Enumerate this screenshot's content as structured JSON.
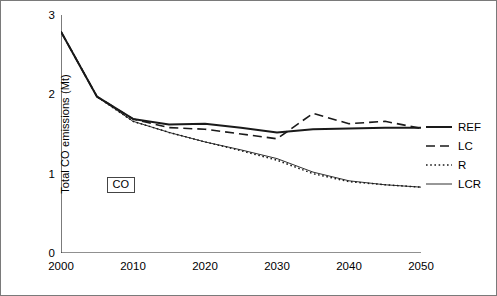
{
  "chart_data": {
    "type": "line",
    "title": "",
    "xlabel": "",
    "ylabel": "Total CO emissions (Mt)",
    "xlim": [
      2000,
      2050
    ],
    "ylim": [
      0,
      3
    ],
    "xticks": [
      2000,
      2010,
      2020,
      2030,
      2040,
      2050
    ],
    "yticks": [
      0,
      1,
      2,
      3
    ],
    "grid": false,
    "legend_position": "right",
    "annotations": [
      {
        "text": "CO",
        "x": 2008,
        "y": 0.85
      }
    ],
    "x": [
      2000,
      2005,
      2010,
      2015,
      2020,
      2025,
      2030,
      2035,
      2040,
      2045,
      2050
    ],
    "series": [
      {
        "name": "REF",
        "style": "solid",
        "color": "#1a1a1a",
        "values": [
          2.79,
          1.97,
          1.69,
          1.62,
          1.63,
          1.58,
          1.52,
          1.56,
          1.57,
          1.58,
          1.58
        ]
      },
      {
        "name": "LC",
        "style": "dashed",
        "color": "#1a1a1a",
        "values": [
          2.79,
          1.97,
          1.69,
          1.58,
          1.56,
          1.5,
          1.44,
          1.76,
          1.63,
          1.66,
          1.57
        ]
      },
      {
        "name": "R",
        "style": "dotted",
        "color": "#1a1a1a",
        "values": [
          2.79,
          1.97,
          1.66,
          1.52,
          1.4,
          1.29,
          1.17,
          1.0,
          0.9,
          0.86,
          0.83
        ]
      },
      {
        "name": "LCR",
        "style": "thin-solid",
        "color": "#1a1a1a",
        "values": [
          2.79,
          1.97,
          1.66,
          1.52,
          1.4,
          1.3,
          1.19,
          1.02,
          0.91,
          0.86,
          0.83
        ]
      }
    ]
  },
  "legend": {
    "items": [
      {
        "label": "REF"
      },
      {
        "label": "LC"
      },
      {
        "label": "R"
      },
      {
        "label": "LCR"
      }
    ]
  }
}
